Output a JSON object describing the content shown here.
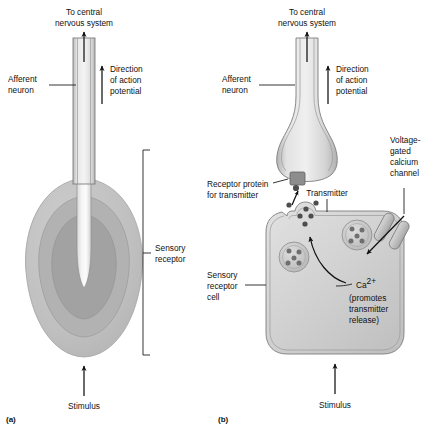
{
  "figure": {
    "background": "#ffffff",
    "text_color": "#111111"
  },
  "panels": [
    {
      "id": "panel-a",
      "label": "(a)",
      "description": "Specialized afferent neuron ending enclosed in concentric connective tissue layers (encapsulated receptor)",
      "labels": {
        "cns": "To central\nnervous system",
        "cns_line1": "To central",
        "cns_line2": "nervous system",
        "afferent": "Afferent\nneuron",
        "afferent_line1": "Afferent",
        "afferent_line2": "neuron",
        "direction_line1": "Direction",
        "direction_line2": "of action",
        "direction_line3": "potential",
        "receptor_line1": "Sensory",
        "receptor_line2": "receptor",
        "stimulus": "Stimulus"
      }
    },
    {
      "id": "panel-b",
      "label": "(b)",
      "description": "Separate sensory receptor cell synapsing onto an afferent neuron terminal",
      "labels": {
        "cns_line1": "To central",
        "cns_line2": "nervous system",
        "afferent_line1": "Afferent",
        "afferent_line2": "neuron",
        "direction_line1": "Direction",
        "direction_line2": "of action",
        "direction_line3": "potential",
        "receptor_protein_line1": "Receptor protein",
        "receptor_protein_line2": "for transmitter",
        "transmitter": "Transmitter",
        "channel_line1": "Voltage-",
        "channel_line2": "gated",
        "channel_line3": "calcium",
        "channel_line4": "channel",
        "calcium_ion": "Ca",
        "calcium_charge": "2+",
        "calcium_note_line1": "(promotes",
        "calcium_note_line2": "transmitter",
        "calcium_note_line3": "release)",
        "receptor_cell_line1": "Sensory",
        "receptor_cell_line2": "receptor",
        "receptor_cell_line3": "cell",
        "stimulus": "Stimulus"
      }
    }
  ],
  "colors": {
    "capsule_outer": "#c2c2c2",
    "capsule_middle": "#b0b0b0",
    "capsule_inner": "#9f9f9f",
    "nerve_ending": "#f2f2f2",
    "axon_fill": "#d8d8d8",
    "cell_fill": "#cfcfcf",
    "vesicle_fill": "#c8c8c8",
    "vesicle_dot": "#6f6f6f",
    "transmitter_dot": "#4a4a4a",
    "channel_fill": "#bdbdbd",
    "receptor_protein_fill": "#8f8f8f",
    "membrane_stroke": "#7d7d7d",
    "line_stroke": "#111111"
  },
  "elements": {
    "vesicles_in_cell": 3,
    "dots_per_vesicle": 5,
    "free_transmitter_dots": 4,
    "arrows": [
      "action-potential-up-a",
      "direction-of-action-potential-a",
      "stimulus-up-a",
      "action-potential-up-b",
      "direction-of-action-potential-b",
      "stimulus-up-b",
      "transmitter-to-receptor-protein",
      "calcium-influx",
      "vesicle-fusion"
    ]
  }
}
